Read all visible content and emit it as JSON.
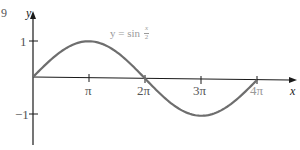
{
  "figure_number": "9",
  "chart_data": {
    "type": "line",
    "title": "",
    "function_label": {
      "lhs": "y = sin",
      "num": "x",
      "den": "2"
    },
    "xlabel": "x",
    "ylabel": "y",
    "x_ticks": [
      "π",
      "2π",
      "3π",
      "4π"
    ],
    "x_tick_values": [
      3.1416,
      6.2832,
      9.4248,
      12.5664
    ],
    "y_ticks": [
      "1",
      "−1"
    ],
    "y_tick_values": [
      1,
      -1
    ],
    "xlim": [
      0,
      13.3
    ],
    "ylim": [
      -1.4,
      1.4
    ],
    "grid": false,
    "series": [
      {
        "name": "y = sin(x/2)",
        "x": [
          0,
          1.5708,
          3.1416,
          4.7124,
          6.2832,
          7.854,
          9.4248,
          10.9956,
          12.5664
        ],
        "values": [
          0,
          0.707,
          1,
          0.707,
          0,
          -0.707,
          -1,
          -0.707,
          0
        ]
      }
    ],
    "colors": {
      "curve": "#6e6e6e",
      "axes": "#1a1a1a",
      "label": "#9a9a9a"
    }
  }
}
